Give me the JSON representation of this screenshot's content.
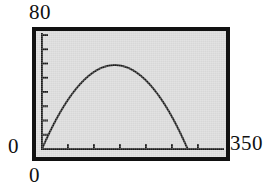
{
  "screen": {
    "frame_color": "#111111",
    "lcd_background": "#d7d7d7",
    "trace_color": "#1a1a1a"
  },
  "labels": {
    "y_max": "80",
    "y_min": "0",
    "x_min": "0",
    "x_max": "350"
  },
  "chart_data": {
    "type": "line",
    "title": "",
    "xlabel": "",
    "ylabel": "",
    "xlim": [
      0,
      350
    ],
    "ylim": [
      0,
      80
    ],
    "grid": false,
    "legend": "none",
    "x_tick_labels": [
      "0",
      "350"
    ],
    "y_tick_labels": [
      "0",
      "80"
    ],
    "x_tick_count": 6,
    "x_tick_step": 50,
    "y_tick_count": 8,
    "y_tick_step": 10,
    "series": [
      {
        "name": "trace",
        "x": [
          0,
          10,
          20,
          30,
          40,
          50,
          60,
          70,
          80,
          90,
          100,
          110,
          120,
          130,
          140,
          150,
          160,
          165,
          170,
          180,
          190,
          200,
          210,
          220,
          230,
          240,
          250,
          260,
          270,
          280,
          290,
          300,
          310,
          320,
          330
        ],
        "y": [
          0,
          8.2,
          15.7,
          22.6,
          28.9,
          34.6,
          39.7,
          44.2,
          48.1,
          51.4,
          54.1,
          56.2,
          57.7,
          58.6,
          58.9,
          58.6,
          57.7,
          57.0,
          56.2,
          54.1,
          51.4,
          48.1,
          44.2,
          39.7,
          34.6,
          28.9,
          22.6,
          15.7,
          8.2,
          0.9,
          0,
          0,
          0,
          0,
          0
        ]
      }
    ],
    "annotations": [
      {
        "text": "peak",
        "x": 145,
        "y": 59
      }
    ]
  }
}
